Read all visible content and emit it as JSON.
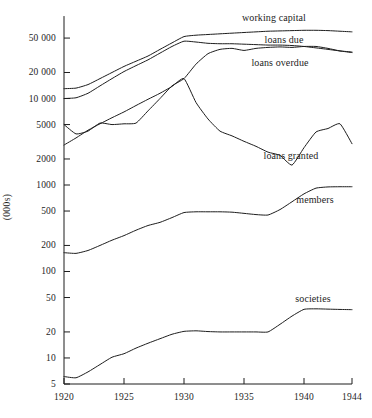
{
  "chart_data": {
    "type": "line",
    "title": "",
    "subtitle": "",
    "xlabel": "",
    "ylabel": "(000s)",
    "yscale": "log",
    "ylim": [
      5,
      90000
    ],
    "xlim": [
      1920,
      1944
    ],
    "grid": false,
    "legend_position": "right-inline-labels",
    "x_ticks": [
      {
        "value": 1920,
        "label": "1920"
      },
      {
        "value": 1925,
        "label": "1925"
      },
      {
        "value": 1930,
        "label": "1930"
      },
      {
        "value": 1935,
        "label": "1935"
      },
      {
        "value": 1940,
        "label": "1940"
      },
      {
        "value": 1944,
        "label": "1944"
      }
    ],
    "y_ticks": [
      {
        "value": 50000,
        "label": "50 000"
      },
      {
        "value": 20000,
        "label": "20 000"
      },
      {
        "value": 10000,
        "label": "10 000"
      },
      {
        "value": 5000,
        "label": "5000"
      },
      {
        "value": 2000,
        "label": "2000"
      },
      {
        "value": 1000,
        "label": "1000"
      },
      {
        "value": 500,
        "label": "500"
      },
      {
        "value": 200,
        "label": "200"
      },
      {
        "value": 100,
        "label": "100"
      },
      {
        "value": 50,
        "label": "50"
      },
      {
        "value": 20,
        "label": "20"
      },
      {
        "value": 10,
        "label": "10"
      },
      {
        "value": 5,
        "label": "5"
      }
    ],
    "line_color": "#1d1d1d",
    "series": [
      {
        "name": "working capital",
        "label": "working capital",
        "label_x": 274,
        "label_y": 17,
        "x": [
          1920,
          1921,
          1922,
          1923,
          1924,
          1925,
          1926,
          1927,
          1928,
          1929,
          1930,
          1931,
          1932,
          1933,
          1934,
          1935,
          1936,
          1937,
          1938,
          1939,
          1940,
          1941,
          1942,
          1943,
          1944
        ],
        "values": [
          13000,
          13200,
          14500,
          17000,
          20000,
          23500,
          27000,
          31000,
          37000,
          44000,
          52000,
          54000,
          55000,
          56000,
          57000,
          58000,
          59000,
          60000,
          60500,
          61000,
          61500,
          61500,
          61000,
          60000,
          59000
        ]
      },
      {
        "name": "loans due",
        "label": "loans due",
        "label_x": 284,
        "label_y": 39,
        "x": [
          1920,
          1921,
          1922,
          1923,
          1924,
          1925,
          1926,
          1927,
          1928,
          1929,
          1930,
          1931,
          1932,
          1933,
          1934,
          1935,
          1936,
          1937,
          1938,
          1939,
          1940,
          1941,
          1942,
          1943,
          1944
        ],
        "values": [
          10000,
          10200,
          11500,
          14000,
          17000,
          20500,
          24000,
          28000,
          33500,
          40000,
          46000,
          45000,
          43500,
          43000,
          43000,
          42500,
          42000,
          41500,
          41500,
          41000,
          40000,
          38500,
          37000,
          35500,
          34500
        ]
      },
      {
        "name": "loans overdue",
        "label": "loans overdue",
        "label_x": 280,
        "label_y": 62,
        "x": [
          1920,
          1921,
          1922,
          1923,
          1924,
          1925,
          1926,
          1927,
          1928,
          1929,
          1930,
          1931,
          1932,
          1933,
          1934,
          1935,
          1936,
          1937,
          1938,
          1939,
          1940,
          1941,
          1942,
          1943,
          1944
        ],
        "values": [
          5000,
          3900,
          4200,
          5200,
          5000,
          5100,
          5200,
          7200,
          10000,
          14000,
          17000,
          25000,
          33000,
          37000,
          38000,
          36000,
          38000,
          39000,
          39500,
          39000,
          40000,
          40000,
          38000,
          35500,
          34000
        ]
      },
      {
        "name": "loans granted",
        "label": "loans granted",
        "label_x": 291,
        "label_y": 155,
        "x": [
          1920,
          1921,
          1922,
          1923,
          1924,
          1925,
          1926,
          1927,
          1928,
          1929,
          1930,
          1931,
          1932,
          1933,
          1934,
          1935,
          1936,
          1937,
          1938,
          1939,
          1940,
          1941,
          1942,
          1943,
          1944
        ],
        "values": [
          2900,
          3500,
          4300,
          5100,
          6000,
          7000,
          8300,
          9800,
          11500,
          13800,
          17000,
          9000,
          5800,
          4200,
          3700,
          3200,
          2800,
          2400,
          2200,
          1700,
          2700,
          4100,
          4500,
          5100,
          3000
        ]
      },
      {
        "name": "members",
        "label": "members",
        "label_x": 315,
        "label_y": 199,
        "x": [
          1920,
          1921,
          1922,
          1923,
          1924,
          1925,
          1926,
          1927,
          1928,
          1929,
          1930,
          1931,
          1932,
          1933,
          1934,
          1935,
          1936,
          1937,
          1938,
          1939,
          1940,
          1941,
          1942,
          1943,
          1944
        ],
        "values": [
          165,
          162,
          175,
          200,
          230,
          260,
          300,
          340,
          370,
          420,
          480,
          490,
          490,
          490,
          485,
          470,
          455,
          450,
          520,
          640,
          790,
          920,
          950,
          955,
          955
        ]
      },
      {
        "name": "societies",
        "label": "societies",
        "label_x": 313,
        "label_y": 298,
        "x": [
          1920,
          1921,
          1922,
          1923,
          1924,
          1925,
          1926,
          1927,
          1928,
          1929,
          1930,
          1931,
          1932,
          1933,
          1934,
          1935,
          1936,
          1937,
          1938,
          1939,
          1940,
          1941,
          1942,
          1943,
          1944
        ],
        "values": [
          6.1,
          5.9,
          6.9,
          8.4,
          10.2,
          11.2,
          13.0,
          14.8,
          16.7,
          18.8,
          20.3,
          20.6,
          20.2,
          20.0,
          20.0,
          20.0,
          20.0,
          20.0,
          24.5,
          30.5,
          36.5,
          37.0,
          36.7,
          36.4,
          36.2
        ]
      }
    ]
  }
}
